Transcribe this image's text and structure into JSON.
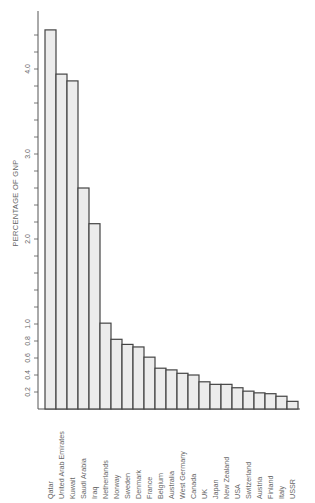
{
  "chart_data": {
    "type": "bar",
    "orientation": "vertical bars, page rotated (labels read bottom-to-top)",
    "title": "",
    "xlabel": "",
    "ylabel": "PERCENTAGE OF GNP",
    "categories": [
      "Qatar",
      "United Arab Emirates",
      "Kuwait",
      "Saudi Arabia",
      "Iraq",
      "Netherlands",
      "Norway",
      "Sweden",
      "Denmark",
      "France",
      "Belgium",
      "Australia",
      "West Germany",
      "Canada",
      "UK",
      "Japan",
      "New Zealand",
      "USA",
      "Switzerland",
      "Austria",
      "Finland",
      "Italy",
      "USSR"
    ],
    "values": [
      4.46,
      3.94,
      3.86,
      2.6,
      2.18,
      1.01,
      0.82,
      0.76,
      0.73,
      0.61,
      0.48,
      0.46,
      0.42,
      0.4,
      0.32,
      0.29,
      0.29,
      0.25,
      0.21,
      0.19,
      0.18,
      0.15,
      0.09
    ],
    "y_ticks": [
      0.2,
      0.4,
      0.6,
      0.8,
      1.0,
      2.0,
      3.0,
      4.0
    ],
    "y_tick_labels": [
      "0.2",
      "0.4",
      "0.6",
      "0.8",
      "1.0",
      "2.0",
      "3.0",
      "4.0"
    ],
    "ylim": [
      0,
      4.6
    ],
    "grid": false,
    "legend": "none",
    "colors": {
      "bar_fill": "#ececec",
      "bar_edge": "#444444",
      "axis": "#555555",
      "text": "#666666"
    }
  }
}
